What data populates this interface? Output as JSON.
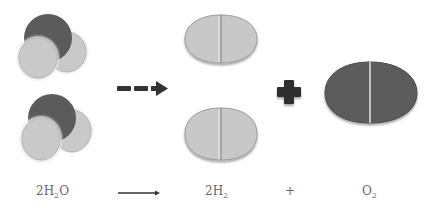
{
  "diagram": {
    "reactant": {
      "label": "2H",
      "sub": "2",
      "tail": "O",
      "name": "water",
      "count": 2
    },
    "products": [
      {
        "label": "2H",
        "sub": "2",
        "name": "hydrogen",
        "count": 2
      },
      {
        "label": "O",
        "sub": "2",
        "name": "oxygen",
        "count": 1
      }
    ],
    "plus_label": "+",
    "colors": {
      "oxygen": "#5a5a5a",
      "hydrogen": "#c8c8c8",
      "arrow": "#333333",
      "text": "#666666"
    }
  }
}
